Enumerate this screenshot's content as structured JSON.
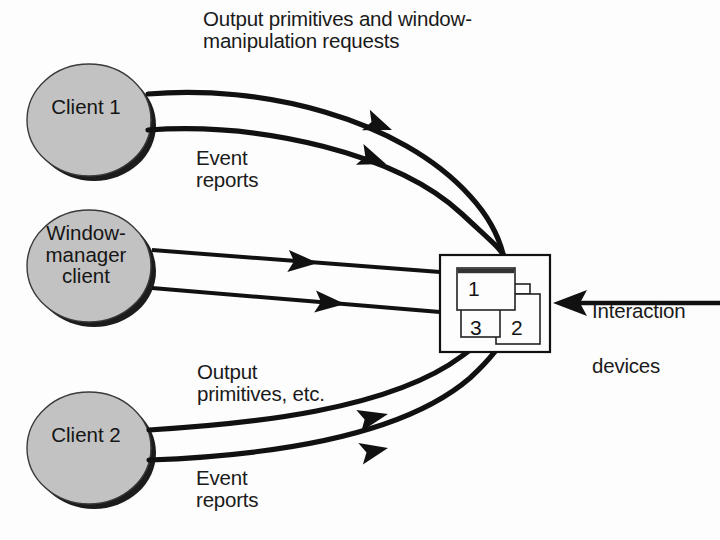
{
  "figure": {
    "kind": "diagram",
    "background_color": "#fdfdfd",
    "ink_color": "#111111",
    "node_fill_color": "#c2c2c2",
    "node_shadow_color": "#1a1a1a"
  },
  "nodes": [
    {
      "id": "client-1",
      "label": "Client 1",
      "shape": "ellipse-shaded"
    },
    {
      "id": "window-manager-client",
      "label": "Window-\nmanager\nclient",
      "shape": "ellipse-shaded"
    },
    {
      "id": "client-2",
      "label": "Client 2",
      "shape": "ellipse-shaded"
    }
  ],
  "display_box": {
    "name": "display-screen",
    "windows": [
      {
        "number": "1",
        "has_title_bar": true
      },
      {
        "number": "2",
        "has_title_bar": false
      },
      {
        "number": "3",
        "has_title_bar": false
      }
    ]
  },
  "edge_labels": {
    "output_window_requests": "Output primitives and window-\nmanipulation requests",
    "event_reports_top": "Event\nreports",
    "output_primitives_etc": "Output\nprimitives, etc.",
    "event_reports_bottom": "Event\nreports",
    "interaction_devices_line1": "Interaction",
    "interaction_devices_line2": "devices"
  },
  "edges": [
    {
      "id": "client1-to-display",
      "from": "client-1",
      "to": "display-screen",
      "label_ref": "output_window_requests",
      "arrow_direction": "left"
    },
    {
      "id": "display-to-client1",
      "from": "display-screen",
      "to": "client-1",
      "label_ref": "event_reports_top",
      "arrow_direction": "left"
    },
    {
      "id": "display-to-wm",
      "from": "display-screen",
      "to": "window-manager-client",
      "arrow_direction": "left"
    },
    {
      "id": "wm-to-display",
      "from": "window-manager-client",
      "to": "display-screen",
      "arrow_direction": "right"
    },
    {
      "id": "client2-to-display",
      "from": "client-2",
      "to": "display-screen",
      "label_ref": "output_primitives_etc",
      "arrow_direction": "right"
    },
    {
      "id": "display-to-client2",
      "from": "display-screen",
      "to": "client-2",
      "label_ref": "event_reports_bottom",
      "arrow_direction": "left"
    },
    {
      "id": "devices-to-display",
      "from": "interaction-devices",
      "to": "display-screen",
      "arrow_direction": "left"
    }
  ]
}
